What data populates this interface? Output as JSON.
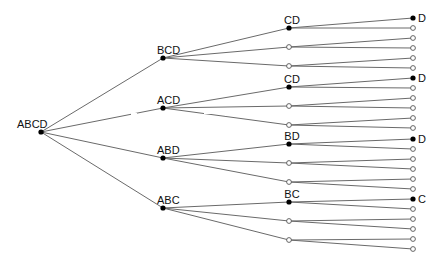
{
  "diagram": {
    "title": "",
    "root": {
      "label": "ABCD",
      "x": 41,
      "y": 132,
      "label_x": 17,
      "label_y": 128
    },
    "level1": [
      {
        "label": "BCD",
        "x": 163,
        "y": 58
      },
      {
        "label": "ACD",
        "x": 163,
        "y": 108
      },
      {
        "label": "ABD",
        "x": 163,
        "y": 158
      },
      {
        "label": "ABC",
        "x": 163,
        "y": 208
      }
    ],
    "level2": [
      {
        "parent": 0,
        "label": "CD",
        "filled": true,
        "x": 289,
        "y": 28
      },
      {
        "parent": 0,
        "label": "",
        "filled": false,
        "x": 289,
        "y": 47
      },
      {
        "parent": 0,
        "label": "",
        "filled": false,
        "x": 289,
        "y": 66
      },
      {
        "parent": 1,
        "label": "CD",
        "filled": true,
        "x": 289,
        "y": 87
      },
      {
        "parent": 1,
        "label": "",
        "filled": false,
        "x": 289,
        "y": 106
      },
      {
        "parent": 1,
        "label": "",
        "filled": false,
        "x": 289,
        "y": 125
      },
      {
        "parent": 2,
        "label": "BD",
        "filled": true,
        "x": 289,
        "y": 144
      },
      {
        "parent": 2,
        "label": "",
        "filled": false,
        "x": 289,
        "y": 163
      },
      {
        "parent": 2,
        "label": "",
        "filled": false,
        "x": 289,
        "y": 182
      },
      {
        "parent": 3,
        "label": "BC",
        "filled": true,
        "x": 289,
        "y": 202
      },
      {
        "parent": 3,
        "label": "",
        "filled": false,
        "x": 289,
        "y": 221
      },
      {
        "parent": 3,
        "label": "",
        "filled": false,
        "x": 289,
        "y": 240
      }
    ],
    "leaf_groups": [
      {
        "label": "D",
        "leaf_x": 413,
        "ys": [
          18,
          28,
          38,
          48,
          58,
          68
        ]
      },
      {
        "label": "D",
        "leaf_x": 413,
        "ys": [
          78,
          88,
          98,
          108,
          118,
          128
        ]
      },
      {
        "label": "D",
        "leaf_x": 413,
        "ys": [
          139,
          149,
          159,
          169,
          179,
          189
        ]
      },
      {
        "label": "C",
        "leaf_x": 413,
        "ys": [
          199,
          209,
          219,
          229,
          239,
          249
        ]
      }
    ],
    "colors": {
      "edge": "#6a6a6a",
      "filled_node": "#000000",
      "empty_node_stroke": "#555555",
      "label": "#111111"
    }
  }
}
